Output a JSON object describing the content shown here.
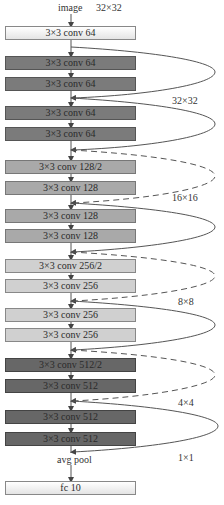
{
  "header": {
    "input_label": "image",
    "input_size": "32×32"
  },
  "layers": [
    {
      "label": "3×3  conv  64",
      "class": "c-in",
      "top": 26
    },
    {
      "label": "3×3  conv  64",
      "class": "c64",
      "top": 56
    },
    {
      "label": "3×3  conv  64",
      "class": "c64",
      "top": 77
    },
    {
      "label": "3×3  conv  64",
      "class": "c64",
      "top": 106
    },
    {
      "label": "3×3  conv  64",
      "class": "c64",
      "top": 127
    },
    {
      "label": "3×3  conv  128/2",
      "class": "c128",
      "top": 160
    },
    {
      "label": "3×3  conv  128",
      "class": "c128",
      "top": 181
    },
    {
      "label": "3×3  conv  128",
      "class": "c128",
      "top": 209
    },
    {
      "label": "3×3  conv  128",
      "class": "c128",
      "top": 229
    },
    {
      "label": "3×3  conv  256/2",
      "class": "c256",
      "top": 259
    },
    {
      "label": "3×3  conv  256",
      "class": "c256",
      "top": 279
    },
    {
      "label": "3×3  conv  256",
      "class": "c256",
      "top": 308
    },
    {
      "label": "3×3  conv  256",
      "class": "c256",
      "top": 328
    },
    {
      "label": "3×3  conv  512/2",
      "class": "c512",
      "top": 358
    },
    {
      "label": "3×3  conv  512",
      "class": "c512",
      "top": 379
    },
    {
      "label": "3×3  conv  512",
      "class": "c512",
      "top": 410
    },
    {
      "label": "3×3  conv  512",
      "class": "c512",
      "top": 432
    }
  ],
  "pool": {
    "label": "avg pool"
  },
  "fc": {
    "label": "fc 10"
  },
  "size_labels": [
    "32×32",
    "16×16",
    "8×8",
    "4×4",
    "1×1"
  ],
  "colors": {
    "conv64": "#7b7b7b",
    "conv128": "#a9a9a9",
    "conv256": "#d0d0d0",
    "conv512": "#676767",
    "line": "#555555"
  }
}
